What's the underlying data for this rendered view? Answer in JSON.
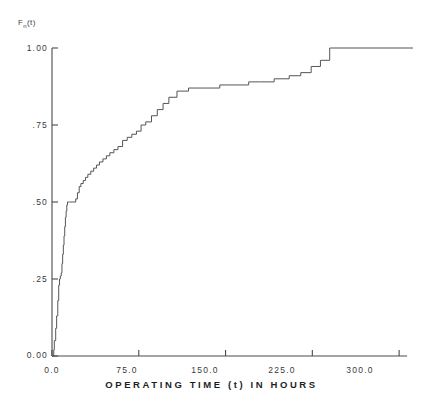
{
  "chart_data": {
    "type": "line",
    "subtype": "step",
    "title": "",
    "xlabel": "OPERATING TIME (t) IN HOURS",
    "ylabel": "F(t)",
    "ylabel_parts": {
      "main": "F",
      "paren": "(t)",
      "sub": "n"
    },
    "xlim": [
      0.0,
      312.0
    ],
    "ylim": [
      0.0,
      1.0
    ],
    "grid": false,
    "legend": false,
    "xticks": [
      0.0,
      75.0,
      150.0,
      225.0,
      300.0
    ],
    "xtick_labels": [
      "0.0",
      "75.0",
      "150.0",
      "225.0",
      "300.0"
    ],
    "yticks": [
      0.0,
      0.25,
      0.5,
      0.75,
      1.0
    ],
    "ytick_labels": [
      "0.00",
      ".25",
      ".50",
      ".75",
      "1.00"
    ],
    "line_color": "#555555",
    "series": [
      {
        "name": "empirical CDF",
        "x": [
          0.0,
          1.5,
          2.0,
          3.2,
          4.0,
          5.0,
          5.8,
          6.5,
          7.2,
          8.0,
          8.6,
          9.2,
          9.8,
          10.4,
          11.0,
          11.6,
          12.2,
          12.8,
          13.4,
          14.0,
          15.0,
          16.2,
          17.5,
          19.0,
          20.5,
          22.0,
          23.5,
          25.0,
          27.0,
          29.0,
          31.0,
          33.5,
          36.0,
          38.5,
          41.0,
          44.0,
          47.0,
          50.0,
          53.5,
          57.0,
          61.0,
          65.0,
          69.0,
          73.0,
          77.0,
          81.0,
          86.0,
          91.0,
          96.0,
          101.0,
          108.0,
          118.0,
          130.0,
          145.0,
          158.0,
          170.0,
          180.0,
          192.0,
          205.0,
          215.0,
          224.0,
          232.0,
          240.0,
          312.0
        ],
        "y": [
          0.0,
          0.02,
          0.05,
          0.09,
          0.13,
          0.18,
          0.23,
          0.25,
          0.26,
          0.27,
          0.3,
          0.33,
          0.36,
          0.39,
          0.42,
          0.45,
          0.47,
          0.49,
          0.5,
          0.5,
          0.5,
          0.5,
          0.5,
          0.5,
          0.51,
          0.53,
          0.55,
          0.56,
          0.57,
          0.58,
          0.59,
          0.6,
          0.61,
          0.62,
          0.63,
          0.64,
          0.65,
          0.66,
          0.67,
          0.68,
          0.7,
          0.71,
          0.72,
          0.73,
          0.75,
          0.76,
          0.78,
          0.8,
          0.82,
          0.84,
          0.86,
          0.87,
          0.87,
          0.88,
          0.88,
          0.89,
          0.89,
          0.9,
          0.91,
          0.92,
          0.94,
          0.96,
          1.0,
          1.0
        ]
      }
    ],
    "annotations": []
  },
  "plot_area": {
    "left_px": 52,
    "right_px": 413,
    "top_px": 48,
    "bottom_px": 356
  }
}
